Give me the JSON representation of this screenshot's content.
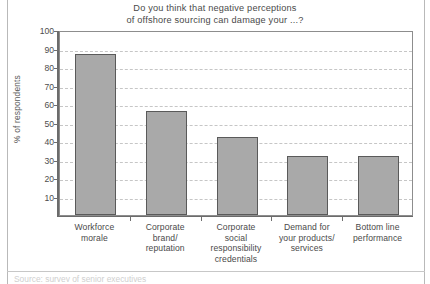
{
  "chart_data": {
    "type": "bar",
    "title": "Do you think that negative perceptions\nof offshore sourcing can damage your ...?",
    "xlabel": "",
    "ylabel": "% of respondents",
    "categories": [
      "Workforce\nmorale",
      "Corporate\nbrand/\nreputation",
      "Corporate\nsocial\nresponsibility\ncredentials",
      "Demand for\nyour products/\nservices",
      "Bottom line\nperformance"
    ],
    "values": [
      87,
      56,
      42,
      32,
      32
    ],
    "ylim": [
      0,
      100
    ],
    "yticks": [
      10,
      20,
      30,
      40,
      50,
      60,
      70,
      80,
      90,
      100
    ],
    "ytick_labels": [
      "10",
      "20",
      "30",
      "40",
      "50",
      "60",
      "70",
      "80",
      "90",
      "100"
    ],
    "grid": true,
    "legend": false,
    "bar_color": "#a9a9a9",
    "bar_border_color": "#5a5a5a",
    "gridline_color": "#c6c6c6",
    "axis_color": "#6b6b6b",
    "plot_border_color": "#8d8d8d",
    "background": "#ffffff"
  },
  "bottom_caption": "Source: survey of senior executives"
}
